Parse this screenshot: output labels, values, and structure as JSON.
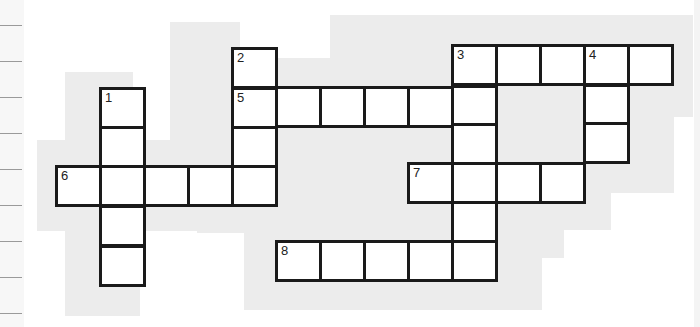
{
  "puzzle": {
    "type": "crossword",
    "background_color": "#ececec",
    "cell_border_color": "#1a1a1a",
    "cell_fill_color": "#ffffff",
    "clue_numbers": [
      "1",
      "2",
      "3",
      "4",
      "5",
      "6",
      "7",
      "8"
    ],
    "words": [
      {
        "number": "1",
        "direction": "down",
        "length": 5
      },
      {
        "number": "2",
        "direction": "down",
        "length": 4
      },
      {
        "number": "3",
        "direction": "down",
        "length": 6
      },
      {
        "number": "3",
        "direction": "across",
        "length": 5
      },
      {
        "number": "4",
        "direction": "down",
        "length": 3
      },
      {
        "number": "5",
        "direction": "across",
        "length": 6
      },
      {
        "number": "6",
        "direction": "across",
        "length": 5
      },
      {
        "number": "7",
        "direction": "across",
        "length": 4
      },
      {
        "number": "8",
        "direction": "across",
        "length": 5
      }
    ],
    "cells": [
      {
        "x": 99,
        "y": 87,
        "num": "1"
      },
      {
        "x": 99,
        "y": 126
      },
      {
        "x": 99,
        "y": 245
      },
      {
        "x": 231,
        "y": 47,
        "num": "2"
      },
      {
        "x": 231,
        "y": 87,
        "num": "5"
      },
      {
        "x": 231,
        "y": 126
      },
      {
        "x": 55,
        "y": 165,
        "num": "6"
      },
      {
        "x": 99,
        "y": 165
      },
      {
        "x": 143,
        "y": 165
      },
      {
        "x": 187,
        "y": 165
      },
      {
        "x": 231,
        "y": 165
      },
      {
        "x": 99,
        "y": 205
      },
      {
        "x": 275,
        "y": 86
      },
      {
        "x": 319,
        "y": 86
      },
      {
        "x": 363,
        "y": 86
      },
      {
        "x": 407,
        "y": 86
      },
      {
        "x": 451,
        "y": 44,
        "num": "3"
      },
      {
        "x": 495,
        "y": 44
      },
      {
        "x": 539,
        "y": 44
      },
      {
        "x": 583,
        "y": 44,
        "num": "4"
      },
      {
        "x": 627,
        "y": 44
      },
      {
        "x": 451,
        "y": 85
      },
      {
        "x": 451,
        "y": 123
      },
      {
        "x": 583,
        "y": 84
      },
      {
        "x": 583,
        "y": 122
      },
      {
        "x": 407,
        "y": 162,
        "num": "7"
      },
      {
        "x": 451,
        "y": 162
      },
      {
        "x": 495,
        "y": 162
      },
      {
        "x": 539,
        "y": 162
      },
      {
        "x": 451,
        "y": 201
      },
      {
        "x": 275,
        "y": 240,
        "num": "8"
      },
      {
        "x": 319,
        "y": 240
      },
      {
        "x": 363,
        "y": 240
      },
      {
        "x": 407,
        "y": 240
      },
      {
        "x": 451,
        "y": 240
      }
    ]
  },
  "margin": {
    "ruled_lines_y": [
      25,
      61,
      97,
      133,
      169,
      205,
      241,
      277,
      313
    ]
  }
}
